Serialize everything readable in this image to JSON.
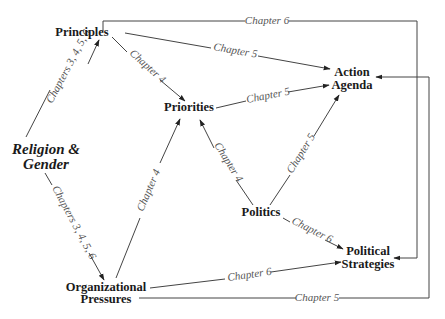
{
  "diagram": {
    "nodes": {
      "principles": "Principles",
      "action_agenda_line1": "Action",
      "action_agenda_line2": "Agenda",
      "priorities": "Priorities",
      "religion_gender_line1": "Religion &",
      "religion_gender_line2": "Gender",
      "politics": "Politics",
      "political_strategies_line1": "Political",
      "political_strategies_line2": "Strategies",
      "org_pressures_line1": "Organizational",
      "org_pressures_line2": "Pressures"
    },
    "edges": [
      {
        "from": "Religion & Gender",
        "to": "Principles",
        "label": "Chapters 3, 4, 5, 6"
      },
      {
        "from": "Religion & Gender",
        "to": "Organizational Pressures",
        "label": "Chapters 3, 4, 5, 6"
      },
      {
        "from": "Principles",
        "to": "Priorities",
        "label": "Chapter 4"
      },
      {
        "from": "Principles",
        "to": "Action Agenda",
        "label": "Chapter 5"
      },
      {
        "from": "Principles",
        "to": "Political Strategies",
        "label": "Chapter 6"
      },
      {
        "from": "Priorities",
        "to": "Action Agenda",
        "label": "Chapter 5"
      },
      {
        "from": "Politics",
        "to": "Priorities",
        "label": "Chapter 4"
      },
      {
        "from": "Politics",
        "to": "Action Agenda",
        "label": "Chapter 5"
      },
      {
        "from": "Politics",
        "to": "Political Strategies",
        "label": "Chapter 6"
      },
      {
        "from": "Organizational Pressures",
        "to": "Priorities",
        "label": "Chapter 4"
      },
      {
        "from": "Organizational Pressures",
        "to": "Political Strategies",
        "label": "Chapter 6"
      },
      {
        "from": "Organizational Pressures",
        "to": "Action Agenda",
        "label": "Chapter 5"
      }
    ]
  }
}
